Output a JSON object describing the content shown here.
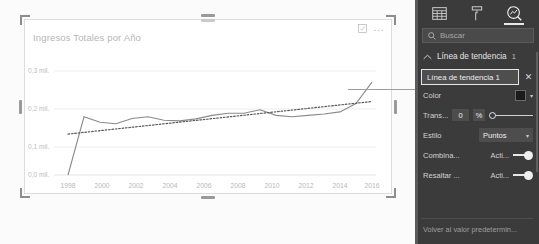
{
  "visual": {
    "title": "Ingresos Totales por Año",
    "focus_icon": "focus-mode-icon",
    "more_icon": "more-options-icon",
    "more_label": "..."
  },
  "chart_data": {
    "type": "line",
    "title": "Ingresos Totales por Año",
    "xlabel": "",
    "ylabel": "",
    "grid": true,
    "legend": false,
    "ylim": [
      0,
      0.35
    ],
    "ytick_labels": [
      "0,0 mil.",
      "0,1 mil.",
      "0,2 mil.",
      "0,3 mil."
    ],
    "ytick_values": [
      0.0,
      0.1,
      0.2,
      0.3
    ],
    "xtick_labels": [
      "1998",
      "2000",
      "2002",
      "2004",
      "2006",
      "2008",
      "2010",
      "2012",
      "2014",
      "2016"
    ],
    "xlim": [
      1998,
      2017
    ],
    "series": [
      {
        "name": "Ingresos Totales",
        "style": "solid",
        "color": "#8a8a8a",
        "x": [
          1998,
          1999,
          2000,
          2001,
          2002,
          2003,
          2004,
          2005,
          2006,
          2007,
          2008,
          2009,
          2010,
          2011,
          2012,
          2013,
          2014,
          2015,
          2016,
          2017
        ],
        "values": [
          0.0,
          0.168,
          0.152,
          0.148,
          0.163,
          0.168,
          0.158,
          0.156,
          0.162,
          0.172,
          0.178,
          0.178,
          0.188,
          0.172,
          0.168,
          0.172,
          0.176,
          0.182,
          0.206,
          0.268
        ]
      },
      {
        "name": "Línea de tendencia 1",
        "style": "dotted",
        "color": "#5a5a5a",
        "x": [
          1998,
          2017
        ],
        "values": [
          0.118,
          0.212
        ]
      }
    ]
  },
  "panel": {
    "tabs": [
      {
        "name": "fields-tab",
        "icon": "fields-grid-icon",
        "active": false
      },
      {
        "name": "format-tab",
        "icon": "paint-roller-icon",
        "active": false
      },
      {
        "name": "analytics-tab",
        "icon": "analytics-magnifier-icon",
        "active": true
      }
    ],
    "search": {
      "placeholder": "Buscar",
      "value": "",
      "icon": "search-icon"
    },
    "section": {
      "title": "Línea de tendencia",
      "count": "1",
      "chevron": "chevron-up-icon",
      "expanded": true
    },
    "trendline_name": {
      "value": "Línea de tendencia 1",
      "close_label": "✕"
    },
    "properties": [
      {
        "label": "Color",
        "type": "color",
        "value": "#1b1b1b",
        "caret": "▾"
      },
      {
        "label": "Trans...",
        "type": "slider",
        "value": "0",
        "unit": "%"
      },
      {
        "label": "Estilo",
        "type": "dropdown",
        "value": "Puntos",
        "caret": "▾"
      },
      {
        "label": "Combina...",
        "type": "toggle",
        "state": "Acti...",
        "on": true
      },
      {
        "label": "Resaltar ...",
        "type": "toggle",
        "state": "Acti...",
        "on": true
      }
    ],
    "reset_label": "Volver al valor predetermin..."
  }
}
